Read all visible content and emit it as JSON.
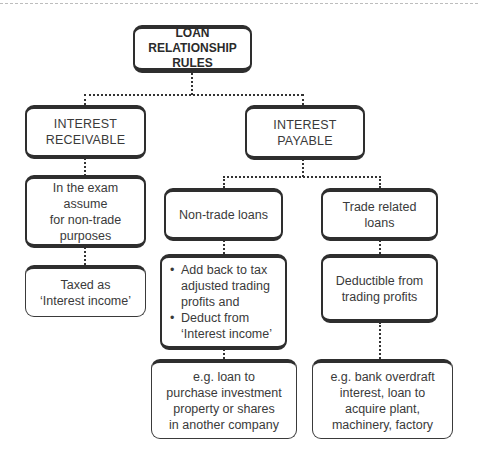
{
  "diagram": {
    "title": {
      "line1": "LOAN",
      "line2": "RELATIONSHIP RULES"
    },
    "receivable": {
      "heading": {
        "line1": "INTEREST",
        "line2": "RECEIVABLE"
      },
      "assumption": {
        "line1": "In the exam assume",
        "line2": "for non-trade",
        "line3": "purposes"
      },
      "treatment": {
        "line1": "Taxed as",
        "line2": "‘Interest income’"
      }
    },
    "payable": {
      "heading": {
        "line1": "INTEREST",
        "line2": "PAYABLE"
      },
      "non_trade": {
        "label": "Non-trade loans",
        "bullets": [
          "Add back to tax adjusted trading profits and",
          "Deduct from ‘Interest income’"
        ],
        "example": {
          "line1": "e.g. loan to",
          "line2": "purchase investment",
          "line3": "property or shares",
          "line4": "in another company"
        }
      },
      "trade": {
        "label": "Trade related loans",
        "treatment": {
          "line1": "Deductible from",
          "line2": "trading profits"
        },
        "example": {
          "line1": "e.g. bank overdraft",
          "line2": "interest, loan to",
          "line3": "acquire plant,",
          "line4": "machinery, factory"
        }
      }
    }
  }
}
